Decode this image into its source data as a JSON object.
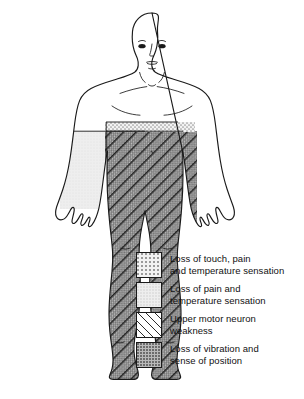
{
  "figure": {
    "view": "anterior full-body human outline",
    "regions": [
      {
        "name": "right-upper-torso-band",
        "pattern": "loss-of-touch-pain-temperature",
        "side": "right",
        "description": "narrow band across upper abdomen on right side"
      },
      {
        "name": "left-torso",
        "pattern": "loss-of-pain-and-temperature",
        "side": "left",
        "description": "left half of trunk from waist to hip"
      },
      {
        "name": "right-torso-and-leg",
        "pattern": "upper-motor-neuron-weakness-over-loss-of-vibration",
        "side": "right",
        "description": "right trunk below band continuing down entire right leg to foot"
      }
    ],
    "unshaded": [
      "head",
      "face",
      "neck",
      "shoulders",
      "chest",
      "arms",
      "hands",
      "left leg",
      "left foot"
    ]
  },
  "legend": {
    "items": [
      {
        "swatch": "loss-of-touch-pain-temperature",
        "line1": "Loss of touch, pain",
        "line2": "and temperature sensation"
      },
      {
        "swatch": "loss-of-pain-and-temperature",
        "line1": "Loss of pain and",
        "line2": "temperature sensation"
      },
      {
        "swatch": "upper-motor-neuron-weakness",
        "line1": "Upper motor neuron",
        "line2": "weakness"
      },
      {
        "swatch": "loss-of-vibration-and-position",
        "line1": "Loss of vibration and",
        "line2": "sense of position"
      }
    ]
  },
  "colors": {
    "outline": "#1a1a1a",
    "touch_fill": "#f2f2f2",
    "touch_dot": "#9a9a9a",
    "paintemp_fill": "#eeeeee",
    "hatch_line": "#2b2b2b",
    "vibration_fill": "#b9b9b9",
    "vibration_dot": "#6d6d6d",
    "background": "#ffffff"
  }
}
